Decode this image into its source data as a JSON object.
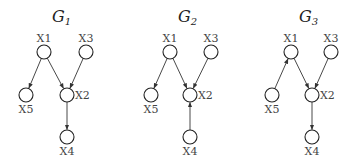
{
  "graphs": [
    {
      "title": "G",
      "subscript": "1",
      "title_pos": [
        60,
        17
      ],
      "nodes": {
        "X1": {
          "label": "X1",
          "x": 44,
          "y": 52,
          "label_pos": "above"
        },
        "X3": {
          "label": "X3",
          "x": 86,
          "y": 52,
          "label_pos": "above"
        },
        "X5": {
          "label": "X5",
          "x": 26,
          "y": 95,
          "label_pos": "below"
        },
        "X2": {
          "label": "X2",
          "x": 67,
          "y": 95,
          "label_pos": "right"
        },
        "X4": {
          "label": "X4",
          "x": 67,
          "y": 137,
          "label_pos": "below"
        }
      },
      "edges": [
        [
          "X1",
          "X5"
        ],
        [
          "X1",
          "X2"
        ],
        [
          "X3",
          "X2"
        ],
        [
          "X2",
          "X4"
        ]
      ]
    },
    {
      "title": "G",
      "subscript": "2",
      "title_pos": [
        186,
        17
      ],
      "nodes": {
        "X1": {
          "label": "X1",
          "x": 170,
          "y": 52,
          "label_pos": "above"
        },
        "X3": {
          "label": "X3",
          "x": 211,
          "y": 52,
          "label_pos": "above"
        },
        "X5": {
          "label": "X5",
          "x": 151,
          "y": 95,
          "label_pos": "below"
        },
        "X2": {
          "label": "X2",
          "x": 190,
          "y": 95,
          "label_pos": "right"
        },
        "X4": {
          "label": "X4",
          "x": 190,
          "y": 137,
          "label_pos": "below"
        }
      },
      "edges": [
        [
          "X1",
          "X5"
        ],
        [
          "X1",
          "X2"
        ],
        [
          "X3",
          "X2"
        ],
        [
          "X4",
          "X2"
        ]
      ]
    },
    {
      "title": "G",
      "subscript": "3",
      "title_pos": [
        307,
        17
      ],
      "nodes": {
        "X1": {
          "label": "X1",
          "x": 291,
          "y": 52,
          "label_pos": "above"
        },
        "X3": {
          "label": "X3",
          "x": 331,
          "y": 52,
          "label_pos": "above"
        },
        "X5": {
          "label": "X5",
          "x": 272,
          "y": 95,
          "label_pos": "below"
        },
        "X2": {
          "label": "X2",
          "x": 312,
          "y": 95,
          "label_pos": "right"
        },
        "X4": {
          "label": "X4",
          "x": 312,
          "y": 137,
          "label_pos": "below"
        }
      },
      "edges": [
        [
          "X5",
          "X1"
        ],
        [
          "X1",
          "X2"
        ],
        [
          "X3",
          "X2"
        ],
        [
          "X2",
          "X4"
        ]
      ]
    }
  ],
  "style": {
    "node_radius": 7,
    "edge_color": "#333333",
    "node_stroke": "#222222",
    "label_color": "#444444"
  }
}
